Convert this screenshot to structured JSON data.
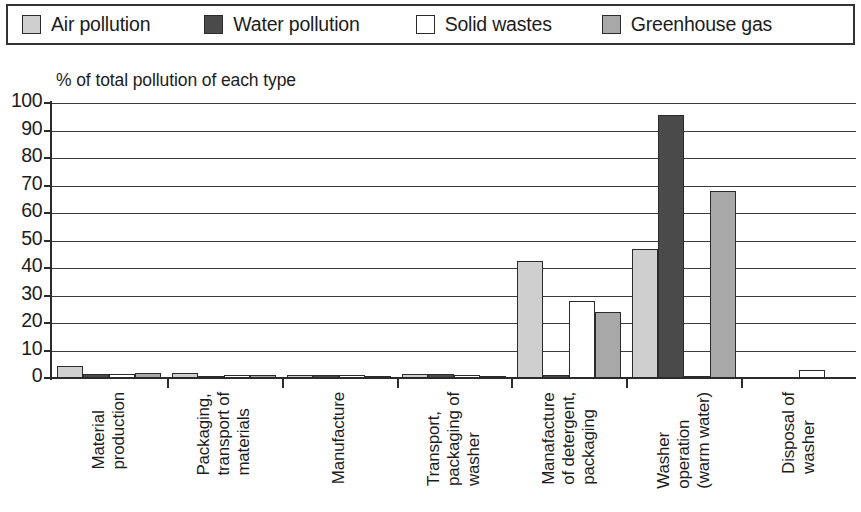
{
  "legend": {
    "items": [
      {
        "label": "Air pollution",
        "color": "#cfcfcf",
        "icon": "legend-swatch-air"
      },
      {
        "label": "Water pollution",
        "color": "#4a4a4a",
        "icon": "legend-swatch-water"
      },
      {
        "label": "Solid wastes",
        "color": "#ffffff",
        "icon": "legend-swatch-solid"
      },
      {
        "label": "Greenhouse gas",
        "color": "#a8a8a8",
        "icon": "legend-swatch-greenhouse"
      }
    ]
  },
  "chart_data": {
    "type": "bar",
    "title": "% of total pollution of each type",
    "xlabel": "",
    "ylabel": "",
    "ylim": [
      0,
      100
    ],
    "yticks": [
      0,
      10,
      20,
      30,
      40,
      50,
      60,
      70,
      80,
      90,
      100
    ],
    "ytick_labels": [
      "0",
      "10",
      "20",
      "30",
      "40",
      "50",
      "60",
      "70",
      "80",
      "90",
      "100"
    ],
    "grid": true,
    "legend_position": "top",
    "categories": [
      "Material\nproduction",
      "Packaging,\ntransport of\nmaterials",
      "Manufacture",
      "Transport,\npackaging of\nwasher",
      "Manafacture\nof detergent,\npackaging",
      "Washer\noperation\n(warm water)",
      "Disposal of\nwasher"
    ],
    "series": [
      {
        "name": "Air pollution",
        "color": "#cfcfcf",
        "values": [
          4.5,
          2,
          1,
          1.5,
          42.5,
          47,
          0
        ]
      },
      {
        "name": "Water pollution",
        "color": "#4a4a4a",
        "values": [
          1.3,
          0.4,
          1,
          1.3,
          1,
          95.5,
          0
        ]
      },
      {
        "name": "Solid wastes",
        "color": "#ffffff",
        "values": [
          1.5,
          1,
          1,
          1,
          28,
          0.5,
          3
        ]
      },
      {
        "name": "Greenhouse gas",
        "color": "#a8a8a8",
        "values": [
          2,
          1,
          0.5,
          0.8,
          24,
          68,
          0
        ]
      }
    ]
  }
}
